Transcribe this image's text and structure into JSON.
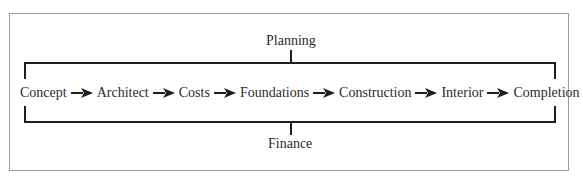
{
  "diagram": {
    "top_label": "Planning",
    "bottom_label": "Finance",
    "steps": [
      {
        "label": "Concept"
      },
      {
        "label": "Architect"
      },
      {
        "label": "Costs"
      },
      {
        "label": "Foundations"
      },
      {
        "label": "Construction"
      },
      {
        "label": "Interior"
      },
      {
        "label": "Completion"
      }
    ],
    "connector": "arrow-right",
    "colors": {
      "line": "#1e1e1e",
      "text": "#2b2b2b",
      "frame_border": "#9a9a9a",
      "background": "#ffffff"
    }
  }
}
